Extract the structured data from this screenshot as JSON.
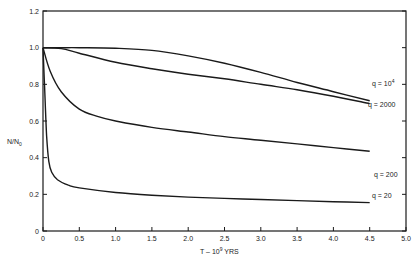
{
  "chart_data": {
    "type": "line",
    "title": "",
    "xlabel": "T - 10^9 YRS",
    "xlabel_parts": {
      "base": "T  –  10",
      "sup": "9",
      "unit": " YRS"
    },
    "ylabel": "N/N0",
    "ylabel_parts": {
      "main": "N/N",
      "sub": "0"
    },
    "xlim": [
      0,
      5.0
    ],
    "ylim": [
      0,
      1.2
    ],
    "xticks": [
      "0",
      "0.5",
      "1.0",
      "1.5",
      "2.0",
      "2.5",
      "3.0",
      "3.5",
      "4.0",
      "4.5",
      "5.0"
    ],
    "yticks": [
      "0",
      "0.2",
      "0.4",
      "0.6",
      "0.8",
      "1.0",
      "1.2"
    ],
    "grid": false,
    "series": [
      {
        "name": "q = 10^4",
        "label_main": "q  = 10",
        "label_sup": "4",
        "x": [
          0,
          0.25,
          0.5,
          1.0,
          1.5,
          2.0,
          2.5,
          3.0,
          3.5,
          4.0,
          4.5
        ],
        "y": [
          1.0,
          1.0,
          1.0,
          0.997,
          0.985,
          0.955,
          0.915,
          0.865,
          0.81,
          0.76,
          0.71
        ]
      },
      {
        "name": "q = 2000",
        "label_main": "q  = 2000",
        "label_sup": "",
        "x": [
          0,
          0.25,
          0.5,
          1.0,
          1.5,
          2.0,
          2.5,
          3.0,
          3.5,
          4.0,
          4.5
        ],
        "y": [
          1.0,
          0.995,
          0.97,
          0.92,
          0.885,
          0.855,
          0.83,
          0.8,
          0.77,
          0.735,
          0.695
        ]
      },
      {
        "name": "q = 200",
        "label_main": "q  = 200",
        "label_sup": "",
        "x": [
          0,
          0.1,
          0.25,
          0.5,
          0.75,
          1.0,
          1.5,
          2.0,
          2.5,
          3.0,
          3.5,
          4.0,
          4.5
        ],
        "y": [
          1.0,
          0.87,
          0.76,
          0.665,
          0.625,
          0.6,
          0.565,
          0.54,
          0.515,
          0.495,
          0.475,
          0.455,
          0.435
        ]
      },
      {
        "name": "q = 20",
        "label_main": "q  = 20",
        "label_sup": "",
        "x": [
          0,
          0.02,
          0.05,
          0.08,
          0.12,
          0.2,
          0.35,
          0.5,
          1.0,
          1.5,
          2.0,
          2.5,
          3.0,
          3.5,
          4.0,
          4.5
        ],
        "y": [
          1.0,
          0.8,
          0.52,
          0.38,
          0.32,
          0.28,
          0.25,
          0.235,
          0.21,
          0.195,
          0.185,
          0.178,
          0.172,
          0.166,
          0.16,
          0.155
        ]
      }
    ]
  },
  "colors": {
    "line": "#1a1a1a",
    "text": "#222222",
    "background": "#ffffff"
  }
}
